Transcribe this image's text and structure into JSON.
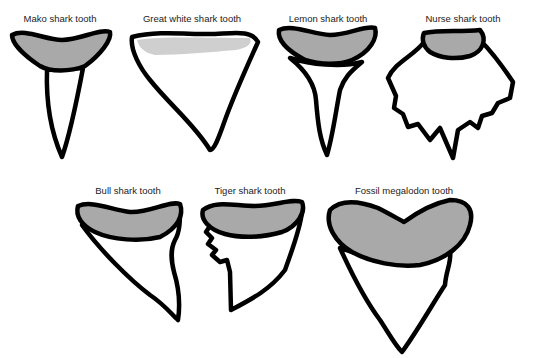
{
  "figure": {
    "type": "illustration",
    "colors": {
      "outline": "#000000",
      "root_fill": "#a9a9a9",
      "blade_fill": "#ffffff",
      "background": "#ffffff"
    },
    "teeth": [
      {
        "id": "mako",
        "label": "Mako shark tooth"
      },
      {
        "id": "great-white",
        "label": "Great white shark tooth"
      },
      {
        "id": "lemon",
        "label": "Lemon shark tooth"
      },
      {
        "id": "nurse",
        "label": "Nurse shark tooth"
      },
      {
        "id": "bull",
        "label": "Bull shark tooth"
      },
      {
        "id": "tiger",
        "label": "Tiger shark tooth"
      },
      {
        "id": "megalodon",
        "label": "Fossil megalodon tooth"
      }
    ]
  }
}
